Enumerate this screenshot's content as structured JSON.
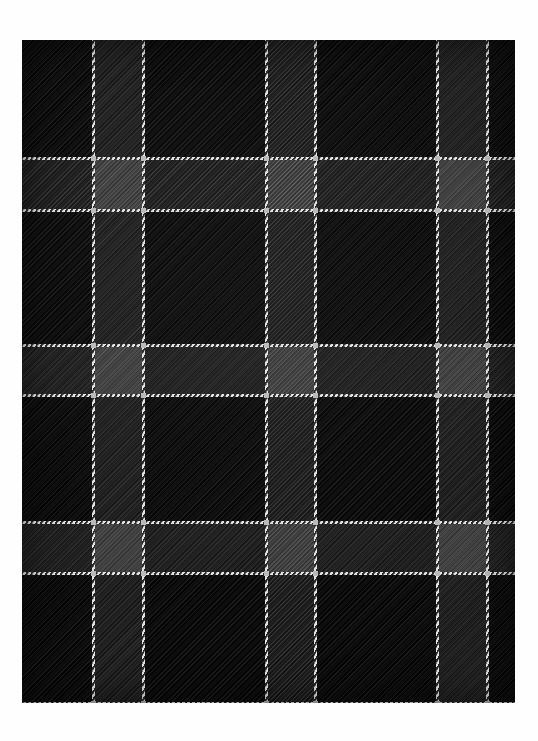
{
  "canvas": {
    "width": 538,
    "height": 741,
    "background_color": "#fefefe",
    "title": "Tartan Fabric Swatch"
  },
  "swatch": {
    "name": "black-watch-style-tartan-swatch",
    "x": 22,
    "y": 40,
    "width": 493,
    "height": 663,
    "weave": "2/2 twill",
    "twill_direction": "diagonal-right-to-left"
  },
  "palette": {
    "ground_black": "#080808",
    "band_dark_grey": "#1d1d1d",
    "band_intersection_grey": "#3a3a3a",
    "guard_stripe_white": "#e2e2e2",
    "knot_highlight": "#b9b9b9",
    "paper_white": "#fefefe"
  },
  "pattern": {
    "description": "Dark tartan / plaid with paired white guard stripes on near-black twill ground",
    "vertical_stripes_x": [
      93,
      143,
      266,
      315,
      437,
      487
    ],
    "horizontal_stripes_y": [
      158,
      210,
      345,
      395,
      522,
      573,
      703
    ],
    "stripe_thickness": 3,
    "vertical_repeat_px": 172,
    "horizontal_repeat_px": 177,
    "pair_gap_px": 50,
    "vertical_bands": [
      {
        "x": 93,
        "width": 50
      },
      {
        "x": 266,
        "width": 49
      },
      {
        "x": 437,
        "width": 50
      }
    ],
    "horizontal_bands": [
      {
        "y": 158,
        "height": 52
      },
      {
        "y": 345,
        "height": 50
      },
      {
        "y": 522,
        "height": 51
      }
    ]
  }
}
